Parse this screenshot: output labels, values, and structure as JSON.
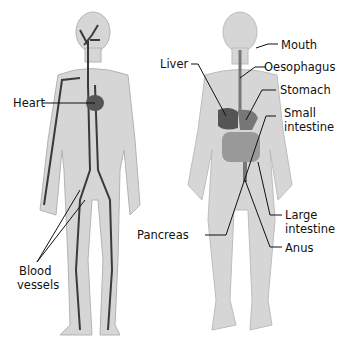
{
  "diagram": {
    "left_figure": {
      "description": "circulatory system",
      "labels": {
        "heart": "Heart",
        "blood_vessels_1": "Blood",
        "blood_vessels_2": "vessels"
      }
    },
    "right_figure": {
      "description": "digestive system",
      "labels": {
        "mouth": "Mouth",
        "oesophagus": "Oesophagus",
        "liver": "Liver",
        "stomach": "Stomach",
        "small_intestine_1": "Small",
        "small_intestine_2": "intestine",
        "large_intestine_1": "Large",
        "large_intestine_2": "intestine",
        "pancreas": "Pancreas",
        "anus": "Anus"
      }
    },
    "colors": {
      "body": "#d4d4d4",
      "outline": "#b0b0b0",
      "vessel": "#3a3a3a",
      "organ": "#555555"
    }
  }
}
